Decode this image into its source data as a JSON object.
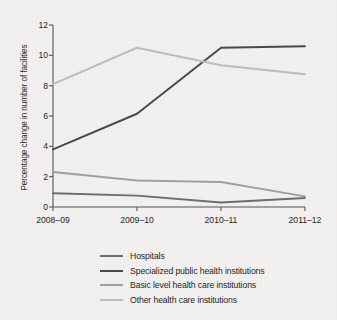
{
  "chart_data": {
    "type": "line",
    "title": "",
    "xlabel": "",
    "ylabel": "Percentage change in number of facilities",
    "categories": [
      "2008–09",
      "2009–10",
      "2010–11",
      "2011–12"
    ],
    "ylim": [
      0,
      12
    ],
    "yticks": [
      0,
      2,
      4,
      6,
      8,
      10,
      12
    ],
    "grid": false,
    "legend_position": "bottom",
    "series": [
      {
        "name": "Hospitals",
        "color": "#6d6d6d",
        "values": [
          0.9,
          0.75,
          0.3,
          0.6
        ]
      },
      {
        "name": "Specialized public health institutions",
        "color": "#4a4a4a",
        "values": [
          3.8,
          6.15,
          10.5,
          10.6
        ]
      },
      {
        "name": "Basic level health care institutions",
        "color": "#a0a0a0",
        "values": [
          2.3,
          1.75,
          1.65,
          0.7
        ]
      },
      {
        "name": "Other health care institutions",
        "color": "#bdbdbd",
        "values": [
          8.1,
          10.5,
          9.35,
          8.75
        ]
      }
    ]
  },
  "axis": {
    "y_title": "Percentage change in number of facilities",
    "y_tick_labels": [
      "0",
      "2",
      "4",
      "6",
      "8",
      "10",
      "12"
    ],
    "x_tick_labels": [
      "2008–09",
      "2009–10",
      "2010–11",
      "2011–12"
    ]
  },
  "legend": {
    "items": [
      {
        "label": "Hospitals"
      },
      {
        "label": "Specialized public health institutions"
      },
      {
        "label": "Basic level health care institutions"
      },
      {
        "label": "Other health care institutions"
      }
    ]
  },
  "style": {
    "axis_color": "#555555",
    "background": "#f2f1ef",
    "text_color": "#1f1f1f"
  }
}
